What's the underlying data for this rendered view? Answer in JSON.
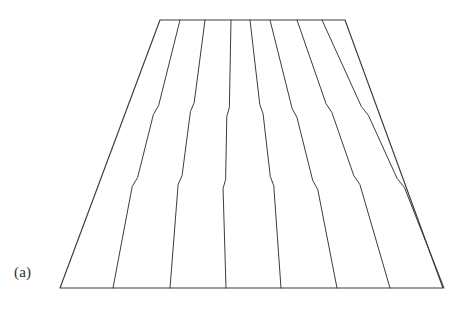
{
  "figure": {
    "label": "(a)",
    "caption": "",
    "type": "line-drawing",
    "background_color": "#ffffff",
    "ink_color": "#3c3c3c",
    "outline_width": 1.15,
    "seam_width": 1.0,
    "canvas": {
      "width": 463,
      "height": 323
    },
    "outline": {
      "top_left": [
        160,
        20
      ],
      "top_right": [
        345,
        20
      ],
      "bottom_right": [
        443,
        288
      ],
      "bottom_left": [
        60,
        288
      ]
    },
    "seam_count": 7,
    "seams": [
      {
        "name": "seam-1",
        "top_x": 180,
        "bottom_x": 113,
        "jog_upper_y": 110,
        "jog_upper_dx": -3.0,
        "jog_lower_y": 182,
        "jog_lower_dx": -3.2
      },
      {
        "name": "seam-2",
        "top_x": 205,
        "bottom_x": 170,
        "jog_upper_y": 107,
        "jog_upper_dx": -2.6,
        "jog_lower_y": 180,
        "jog_lower_dx": -2.8
      },
      {
        "name": "seam-3",
        "top_x": 231,
        "bottom_x": 226,
        "jog_upper_y": 112,
        "jog_upper_dx": -2.4,
        "jog_lower_y": 184,
        "jog_lower_dx": -2.4
      },
      {
        "name": "seam-4",
        "top_x": 250,
        "bottom_x": 281,
        "jog_upper_y": 109,
        "jog_upper_dx": 2.2,
        "jog_lower_y": 181,
        "jog_lower_dx": 2.4
      },
      {
        "name": "seam-5",
        "top_x": 270,
        "bottom_x": 337,
        "jog_upper_y": 113,
        "jog_upper_dx": 2.6,
        "jog_lower_y": 185,
        "jog_lower_dx": 2.8
      },
      {
        "name": "seam-6",
        "top_x": 297,
        "bottom_x": 390,
        "jog_upper_y": 108,
        "jog_upper_dx": 2.8,
        "jog_lower_y": 180,
        "jog_lower_dx": 3.0
      },
      {
        "name": "seam-7",
        "top_x": 322,
        "bottom_x": 444,
        "jog_upper_y": 111,
        "jog_upper_dx": 3.0,
        "jog_lower_y": 183,
        "jog_lower_dx": 3.2
      }
    ]
  }
}
